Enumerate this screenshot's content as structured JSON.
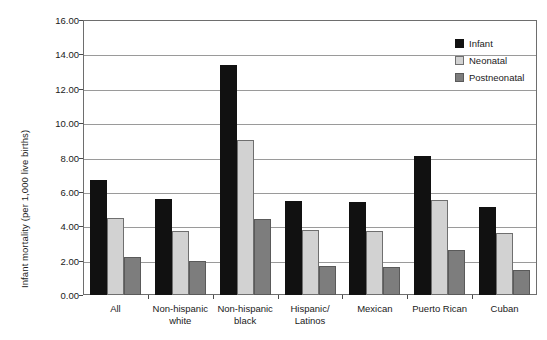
{
  "chart_data": {
    "type": "bar",
    "title": "",
    "xlabel": "",
    "ylabel": "Infant mortality (per 1,000 live births)",
    "ylim": [
      0,
      16
    ],
    "ytick_step": 2,
    "ytick_labels": [
      "0.00",
      "2.00",
      "4.00",
      "6.00",
      "8.00",
      "10.00",
      "12.00",
      "14.00",
      "16.00"
    ],
    "grid": true,
    "legend_position": "top-right",
    "categories": [
      "All",
      "Non-hispanic\nwhite",
      "Non-hispanic\nblack",
      "Hispanic/\nLatinos",
      "Mexican",
      "Puerto Rican",
      "Cuban"
    ],
    "series": [
      {
        "name": "Infant",
        "color": "#111111",
        "values": [
          6.7,
          5.6,
          13.4,
          5.45,
          5.4,
          8.1,
          5.1
        ]
      },
      {
        "name": "Neonatal",
        "color": "#d2d2d2",
        "values": [
          4.5,
          3.7,
          9.0,
          3.8,
          3.75,
          5.5,
          3.6
        ]
      },
      {
        "name": "Postneonatal",
        "color": "#7d7d7d",
        "values": [
          2.2,
          1.95,
          4.4,
          1.7,
          1.65,
          2.6,
          1.45
        ]
      }
    ]
  }
}
